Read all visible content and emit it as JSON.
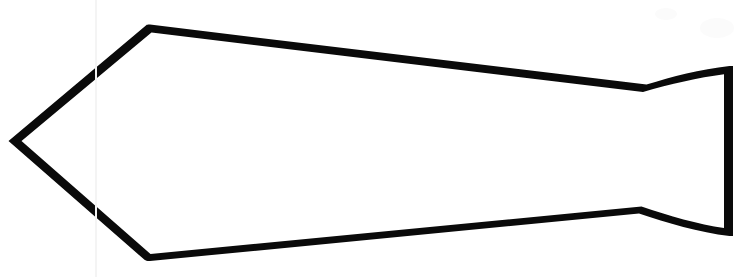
{
  "figure": {
    "title": "Lithic projectile point outline drawing",
    "background_color": "#ffffff",
    "stroke_color": "#0a0a0a",
    "fill_color": "#ffffff",
    "canvas": {
      "width": 752,
      "height": 277
    },
    "outline_path": "M 13 141 L 148 28 L 645 88 C 672 80 700 73 728 70 L 728 232 C 700 228 668 219 640 210 L 145 257 Z",
    "vertices": [
      {
        "name": "blade-tip-apex",
        "x": 13,
        "y": 141
      },
      {
        "name": "upper-shoulder",
        "x": 148,
        "y": 28
      },
      {
        "name": "upper-notch-waist",
        "x": 645,
        "y": 88
      },
      {
        "name": "tang-top-right-corner",
        "x": 728,
        "y": 70
      },
      {
        "name": "tang-bottom-right-corner",
        "x": 728,
        "y": 232
      },
      {
        "name": "lower-notch-waist",
        "x": 640,
        "y": 210
      },
      {
        "name": "lower-shoulder",
        "x": 145,
        "y": 257
      }
    ],
    "stroke_widths": {
      "blade_edges": 6,
      "tang_edges": 5
    },
    "artifacts": {
      "fold_line_x": 95,
      "fold_line_color": "#f4f4f4"
    }
  }
}
